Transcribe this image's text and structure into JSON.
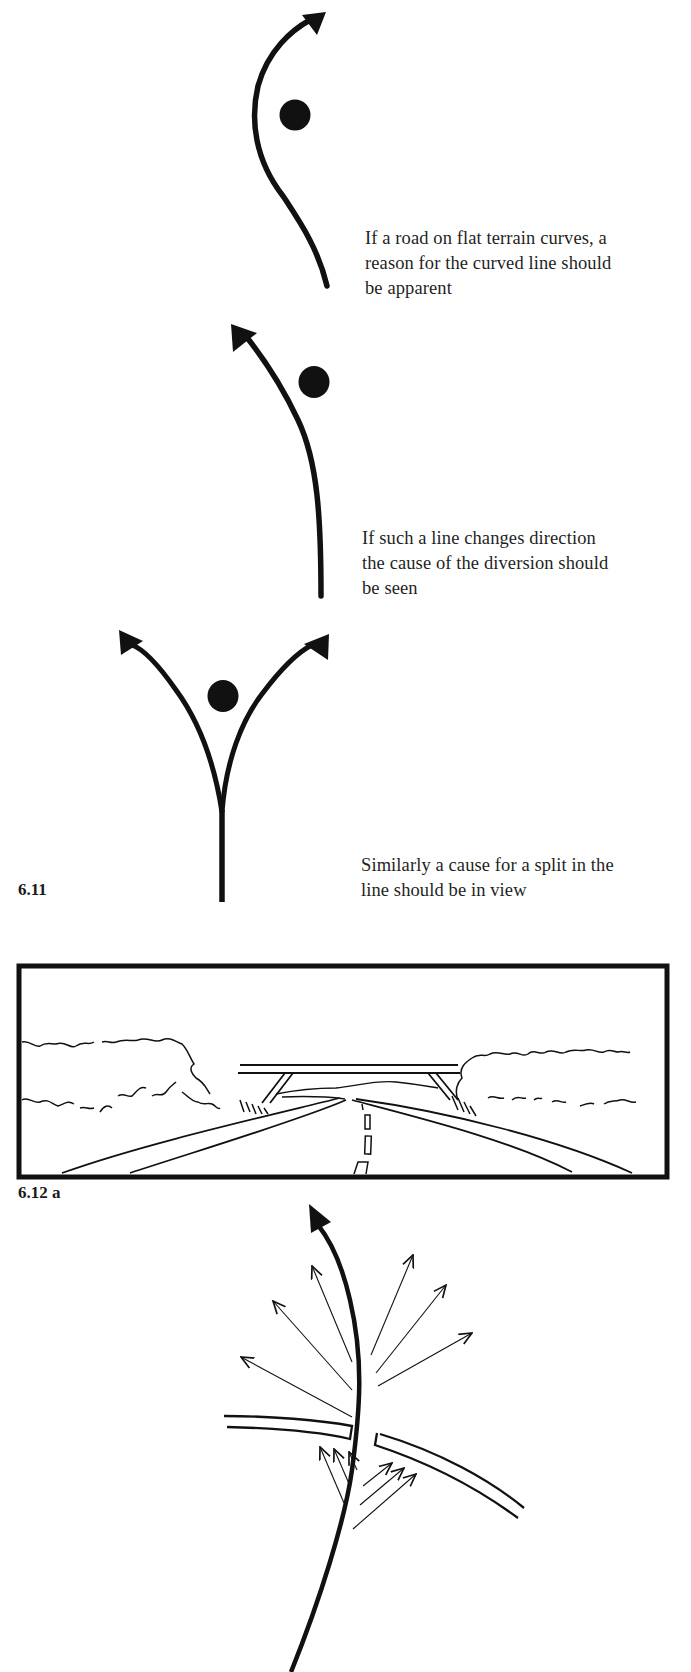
{
  "captions": {
    "curve": [
      "If a road on flat terrain curves, a",
      "reason for the curved line should",
      "be apparent"
    ],
    "direction": [
      "If such a line changes direction",
      "the cause of the diversion should",
      "be seen"
    ],
    "split": [
      "Similarly a cause for a split in the",
      "line should be in view"
    ]
  },
  "figure_labels": {
    "fig_6_11": "6.11",
    "fig_6_12a": "6.12 a"
  },
  "colors": {
    "ink": "#111111",
    "paper": "#ffffff"
  }
}
